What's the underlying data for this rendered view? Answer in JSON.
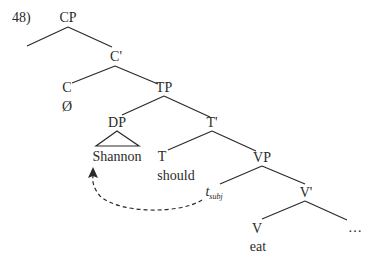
{
  "example_number": "48)",
  "nodes": {
    "cp": "CP",
    "c_bar": "C'",
    "c": "C",
    "c_null": "Ø",
    "tp": "TP",
    "dp": "DP",
    "dp_content": "Shannon",
    "t_bar": "T'",
    "t": "T",
    "t_word": "should",
    "vp": "VP",
    "trace_main": "t",
    "trace_sub": "subj",
    "v_bar": "V'",
    "v": "V",
    "v_word": "eat",
    "ellipsis": "…"
  },
  "colors": {
    "line": "#2a2a2a",
    "text": "#2a2a2a",
    "background": "#ffffff"
  },
  "arrow": {
    "from": "t_subj",
    "to": "Shannon",
    "style": "dashed"
  }
}
